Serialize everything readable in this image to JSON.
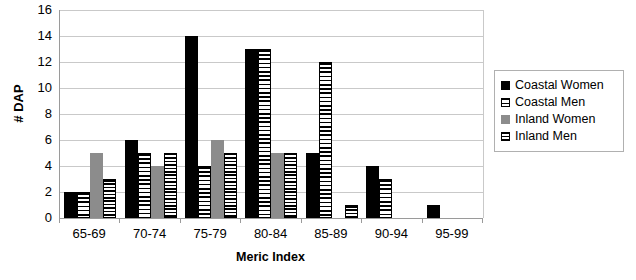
{
  "chart_data": {
    "type": "bar",
    "title": "",
    "xlabel": "Meric Index",
    "ylabel": "# DAP",
    "categories": [
      "65-69",
      "70-74",
      "75-79",
      "80-84",
      "85-89",
      "90-94",
      "95-99"
    ],
    "series": [
      {
        "name": "Coastal Women",
        "values": [
          2,
          6,
          14,
          13,
          5,
          4,
          1
        ],
        "color": "#000000",
        "pattern": "solid-black"
      },
      {
        "name": "Coastal Men",
        "values": [
          2,
          5,
          4,
          13,
          12,
          3,
          0
        ],
        "color": "#ffffff",
        "pattern": "horizontal-stripes"
      },
      {
        "name": "Inland Women",
        "values": [
          5,
          4,
          6,
          5,
          0,
          0,
          0
        ],
        "color": "#8c8c8c",
        "pattern": "solid-gray"
      },
      {
        "name": "Inland Men",
        "values": [
          3,
          5,
          5,
          5,
          1,
          0,
          0
        ],
        "color": "#ffffff",
        "pattern": "dense-horizontal-stripes"
      }
    ],
    "ylim": [
      0,
      16
    ],
    "ytick_step": 2,
    "yticks": [
      "16",
      "14",
      "12",
      "10",
      "8",
      "6",
      "4",
      "2",
      "0"
    ],
    "grid": true,
    "legend_position": "right"
  }
}
